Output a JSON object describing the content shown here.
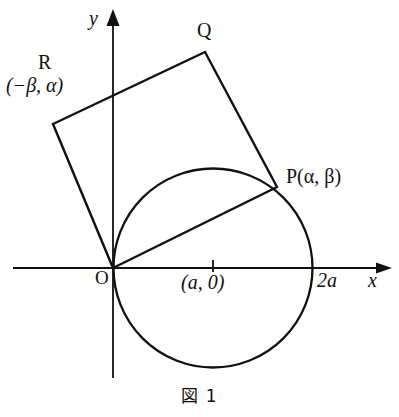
{
  "figure": {
    "caption": "図 1",
    "axes": {
      "x_label": "x",
      "y_label": "y",
      "origin_label": "O"
    },
    "points": [
      {
        "id": "O",
        "name": "O",
        "label": "O",
        "x": 113,
        "y": 268
      },
      {
        "id": "P",
        "name": "P",
        "label": "P(α, β)",
        "x": 277,
        "y": 187
      },
      {
        "id": "Q",
        "name": "Q",
        "label": "Q",
        "x": 205,
        "y": 52
      },
      {
        "id": "R",
        "name": "R",
        "label": "R",
        "coords_label": "(−β, α)",
        "x": 53,
        "y": 124
      }
    ],
    "labels": {
      "p_label": "P(α, β)",
      "q_label": "Q",
      "r_label": "R",
      "r_coords": "(−β, α)",
      "center_label": "(a, 0)",
      "diameter_label": "2a"
    },
    "circle": {
      "center_label": "(a, 0)",
      "right_intercept_label": "2a",
      "center_x": 213,
      "center_y": 268,
      "radius": 99
    },
    "style": {
      "stroke": "#111111",
      "background": "#ffffff",
      "line_width": 2.2,
      "axis_width": 1.6
    }
  }
}
